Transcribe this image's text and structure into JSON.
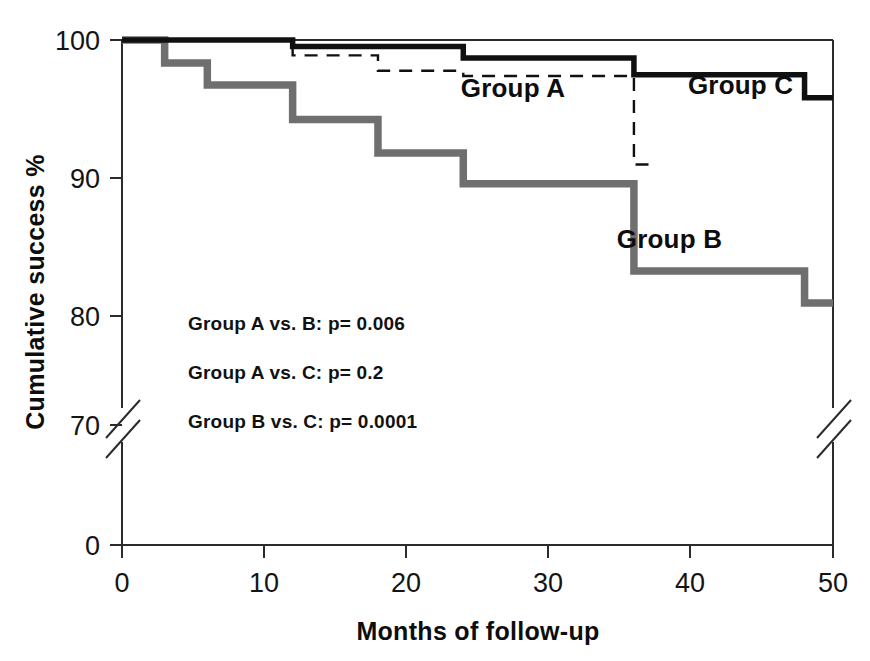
{
  "chart_data": {
    "type": "line",
    "subtype": "kaplan-meier-step",
    "title": "",
    "xlabel": "Months of follow-up",
    "ylabel": "Cumulative success %",
    "xlim": [
      0,
      50
    ],
    "ylim": [
      0,
      100
    ],
    "y_axis_break": true,
    "y_axis_break_between": [
      0,
      70
    ],
    "x_ticks": [
      0,
      10,
      20,
      30,
      40,
      50
    ],
    "x_tick_labels": [
      "0",
      "10",
      "20",
      "30",
      "40",
      "50"
    ],
    "y_ticks": [
      0,
      70,
      80,
      90,
      100
    ],
    "y_tick_labels": [
      "0",
      "70",
      "80",
      "90",
      "100"
    ],
    "grid": false,
    "legend_position": "inline-annotations",
    "series": [
      {
        "name": "Group A",
        "style": "dashed-thin",
        "color": "#101010",
        "x": [
          0,
          12,
          12,
          18,
          18,
          24,
          24,
          36,
          36,
          37.6
        ],
        "y": [
          100,
          100,
          98.8,
          98.8,
          97.6,
          97.6,
          97.2,
          97.2,
          90.3,
          90.3
        ],
        "label_x": 27.5,
        "label_y": 95.6
      },
      {
        "name": "Group B",
        "style": "solid-thick-gray",
        "color": "#6f6f6f",
        "x": [
          0,
          3,
          3,
          6,
          6,
          12,
          12,
          18,
          18,
          24,
          24,
          36,
          36,
          48,
          48,
          50
        ],
        "y": [
          100,
          100,
          98.2,
          98.2,
          96.5,
          96.5,
          93.8,
          93.8,
          91.2,
          91.2,
          88.8,
          88.8,
          82.0,
          82.0,
          79.5,
          79.5
        ],
        "label_x": 38.5,
        "label_y": 83.8
      },
      {
        "name": "Group C",
        "style": "solid-thick-black",
        "color": "#101010",
        "x": [
          0,
          12,
          12,
          24,
          24,
          36,
          36,
          48,
          48,
          50
        ],
        "y": [
          100,
          100,
          99.5,
          99.5,
          98.6,
          98.6,
          97.3,
          97.3,
          95.5,
          95.5
        ],
        "label_x": 43.5,
        "label_y": 95.8
      }
    ],
    "annotations": [
      "Group A vs. B: p= 0.006",
      "Group A vs. C: p= 0.2",
      "Group B vs. C: p= 0.0001"
    ]
  },
  "axis": {
    "x_title": "Months of follow-up",
    "y_title": "Cumulative success %",
    "x_tick_labels": [
      "0",
      "10",
      "20",
      "30",
      "40",
      "50"
    ],
    "y_tick_labels": [
      "100",
      "90",
      "80",
      "70",
      "0"
    ]
  },
  "series_labels": {
    "group_a": "Group A",
    "group_b": "Group B",
    "group_c": "Group C"
  },
  "stats": {
    "line1": "Group A vs. B: p= 0.006",
    "line2": "Group A vs. C: p= 0.2",
    "line3": "Group B vs. C: p= 0.0001"
  },
  "colors": {
    "group_b_gray": "#6f6f6f",
    "curve_black": "#101010",
    "axis": "#2b2b2b",
    "background": "#ffffff"
  }
}
